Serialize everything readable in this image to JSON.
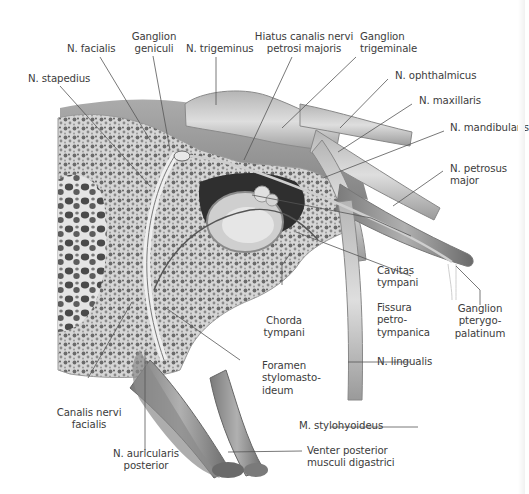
{
  "figure": {
    "colors": {
      "background": "#ffffff",
      "label_text": "#3c3c3c",
      "leader_line": "#555555",
      "bone_fill": "#d8d8d8",
      "bone_pore": "#6d6d6d",
      "nerve_fill": "#c9c9c9",
      "muscle_fill": "#8f8f8f",
      "cavity_dark": "#2e2e2e"
    }
  },
  "labels": {
    "n_stapedius": "N. stapedius",
    "n_facialis": "N. facialis",
    "ganglion_geniculi": [
      "Ganglion",
      "geniculi"
    ],
    "n_trigeminus": "N. trigeminus",
    "hiatus": [
      "Hiatus canalis nervi",
      "petrosi majoris"
    ],
    "ganglion_trigeminale": [
      "Ganglion",
      "trigeminale"
    ],
    "n_ophthalmicus": "N. ophthalmicus",
    "n_maxillaris": "N. maxillaris",
    "n_mandibularis": "N. mandibularis",
    "n_petrosus_major": [
      "N. petrosus",
      "major"
    ],
    "cavitas_tympani": [
      "Cavitas",
      "tympani"
    ],
    "fissura": [
      "Fissura",
      "petro-",
      "tympanica"
    ],
    "ganglion_pterygo": [
      "Ganglion",
      "pterygo-",
      "palatinum"
    ],
    "chorda_tympani": [
      "Chorda",
      "tympani"
    ],
    "foramen": [
      "Foramen",
      "stylomasto-",
      "ideum"
    ],
    "n_lingualis": "N. lingualis",
    "canalis": [
      "Canalis nervi",
      "facialis"
    ],
    "m_stylohyoideus": "M. stylohyoideus",
    "n_auricularis": [
      "N. auricularis",
      "posterior"
    ],
    "venter": [
      "Venter posterior",
      "musculi digastrici"
    ]
  }
}
